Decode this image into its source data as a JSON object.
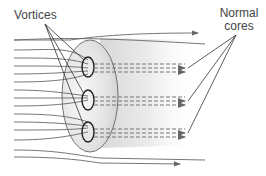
{
  "diagram": {
    "labels": {
      "vortices": "Vortices",
      "normal_cores": [
        "Normal",
        "cores"
      ]
    },
    "vortex_count": 3,
    "colors": {
      "field_line": "#666666",
      "sample_fill": "#dddddd",
      "annotation_line": "#333333",
      "label_text": "#444444"
    }
  }
}
